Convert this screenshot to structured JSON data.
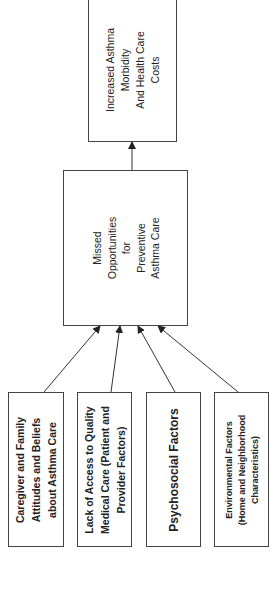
{
  "diagram": {
    "orientation": "rotated-90-ccw",
    "colors": {
      "line": "#333333",
      "border": "#444444",
      "text": "#222222",
      "background": "#ffffff"
    },
    "outcome": {
      "label": "Increased Asthma\nMorbidity\nAnd Health Care\nCosts"
    },
    "middle": {
      "label": "Missed\nOpportunities\nfor\nPreventive\nAsthma Care"
    },
    "factors": [
      {
        "label": "Caregiver and Family\nAttitudes and Beliefs\nabout Asthma Care"
      },
      {
        "label": "Lack of Access to Quality\nMedical Care (Patient and\nProvider Factors)"
      },
      {
        "label": "Psychosocial Factors"
      },
      {
        "label": "Environmental Factors\n(Home and Neighborhood\nCharacteristics)"
      }
    ],
    "edges": [
      {
        "from": "factors.0",
        "to": "middle"
      },
      {
        "from": "factors.1",
        "to": "middle"
      },
      {
        "from": "factors.2",
        "to": "middle"
      },
      {
        "from": "factors.3",
        "to": "middle"
      },
      {
        "from": "middle",
        "to": "outcome"
      }
    ]
  }
}
